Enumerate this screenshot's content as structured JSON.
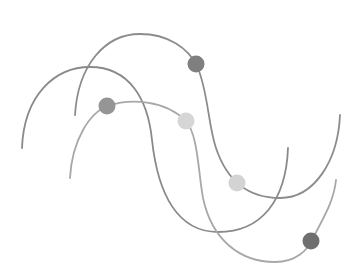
{
  "illustration": {
    "background": "#ffffff",
    "curves": [
      {
        "id": "wave-1",
        "color": "#8a8a8a",
        "width": 1.8,
        "d": "M22,148 C24,95 55,67 90,67 C130,67 148,100 152,140 C158,195 178,232 218,232 C262,232 286,200 288,148"
      },
      {
        "id": "wave-2",
        "color": "#8c8c8c",
        "width": 1.8,
        "d": "M75,115 C78,65 105,34 140,34 C168,34 188,48 197,66 C208,90 208,125 216,148 C226,178 245,198 280,198 C315,198 338,160 340,115"
      },
      {
        "id": "wave-3",
        "color": "#a8a8a8",
        "width": 1.8,
        "d": "M70,178 C72,140 90,112 108,106 C130,98 165,100 186,121 C198,135 198,170 203,198 C212,240 240,262 275,262 C296,262 308,250 313,238 C325,215 334,200 336,180"
      }
    ],
    "dots": [
      {
        "id": "dot-1",
        "cx": 196,
        "cy": 64,
        "r": 8.5,
        "color": "#7f7f7f"
      },
      {
        "id": "dot-2",
        "cx": 107,
        "cy": 106,
        "r": 8.5,
        "color": "#959595"
      },
      {
        "id": "dot-3",
        "cx": 186,
        "cy": 121,
        "r": 8.5,
        "color": "#d6d6d6"
      },
      {
        "id": "dot-4",
        "cx": 237,
        "cy": 183,
        "r": 8.5,
        "color": "#d3d3d3"
      },
      {
        "id": "dot-5",
        "cx": 311,
        "cy": 241,
        "r": 8.5,
        "color": "#6f6f6f"
      }
    ]
  }
}
